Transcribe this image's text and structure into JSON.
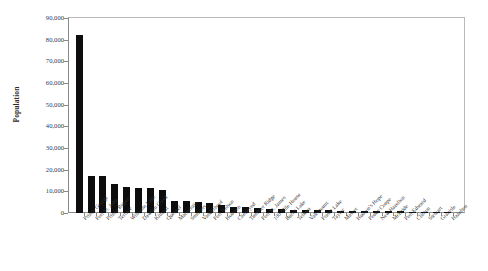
{
  "chart_data": {
    "type": "bar",
    "title": "",
    "xlabel": "",
    "ylabel": "Population",
    "ylim": [
      0,
      90000
    ],
    "ytick_labels": [
      "0",
      "10,000",
      "20,000",
      "30,000",
      "40,000",
      "50,000",
      "60,000",
      "70,000",
      "80,000",
      "90,000"
    ],
    "ytick_values": [
      0,
      10000,
      20000,
      30000,
      40000,
      50000,
      60000,
      70000,
      80000,
      90000
    ],
    "grid": false,
    "legend": "none",
    "bar_color": "#0d0d0d",
    "categories": [
      "Prince George",
      "Fort St. John",
      "Prince Rupert",
      "Terrace",
      "Williams Lake",
      "Dawson Creek",
      "Kitimat",
      "Quesnel",
      "Mackenzie",
      "Smithers",
      "Vanderhoof",
      "Fort Nelson",
      "Houston",
      "Chetwynd",
      "Tumbler Ridge",
      "Fort St. James",
      "100 Mile House",
      "Burns Lake",
      "Telkwa",
      "Valemount",
      "Fraser Lake",
      "Taylor",
      "Masset",
      "Hudson's Hope",
      "Pouce Coupe",
      "New Hazelton",
      "McBride",
      "Port Edward",
      "Clinton",
      "Stewart",
      "Granisle",
      "Hazelton"
    ],
    "values": [
      82000,
      17000,
      17000,
      13500,
      12000,
      11700,
      11500,
      10700,
      5700,
      5500,
      5000,
      4400,
      3900,
      3000,
      2700,
      2200,
      2000,
      1900,
      1500,
      1300,
      1300,
      1200,
      1100,
      1000,
      900,
      850,
      800,
      750,
      650,
      600,
      400,
      350
    ]
  }
}
